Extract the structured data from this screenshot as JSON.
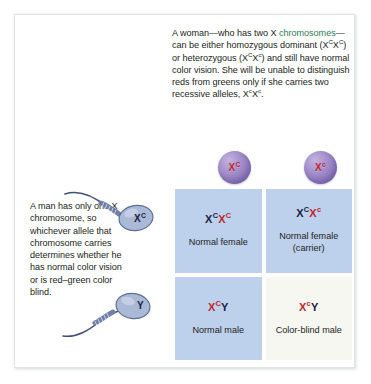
{
  "figure": {
    "female_caption": {
      "segments": [
        {
          "text": "A woman—who has two X ",
          "style": "normal"
        },
        {
          "text": "chromosomes",
          "style": "green"
        },
        {
          "text": "—can be either homozygous dominant (X",
          "style": "normal"
        },
        {
          "text": "C",
          "style": "sup"
        },
        {
          "text": "X",
          "style": "normal"
        },
        {
          "text": "C",
          "style": "sup"
        },
        {
          "text": ") or heterozygous (X",
          "style": "normal"
        },
        {
          "text": "C",
          "style": "sup"
        },
        {
          "text": "X",
          "style": "normal"
        },
        {
          "text": "c",
          "style": "sup"
        },
        {
          "text": ") and still have normal color vision. She will be unable to distinguish reds from greens only if she carries two recessive alleles, X",
          "style": "normal"
        },
        {
          "text": "c",
          "style": "sup"
        },
        {
          "text": "X",
          "style": "normal"
        },
        {
          "text": "c",
          "style": "sup"
        },
        {
          "text": ".",
          "style": "normal"
        }
      ],
      "plain_text": "A woman—who has two X chromosomes—can be either homozygous dominant (XCXC) or heterozygous (XCXc) and still have normal color vision. She will be unable to distinguish reds from greens only if she carries two recessive alleles, XcXc."
    },
    "male_caption": {
      "plain_text": "A man has only one X chromosome, so whichever allele that chromosome carries determines whether he has normal color vision or is red–green color blind."
    },
    "eggs": [
      {
        "name": "egg-dominant",
        "allele_base": "X",
        "allele_sup": "C",
        "color": "#8e78bd",
        "text_color": "#c0272d"
      },
      {
        "name": "egg-recessive",
        "allele_base": "X",
        "allele_sup": "c",
        "color": "#8e78bd",
        "text_color": "#c0272d"
      }
    ],
    "sperm": [
      {
        "name": "sperm-dominant",
        "allele_base": "X",
        "allele_sup": "C",
        "color": "#8fa6cc"
      },
      {
        "name": "sperm-y",
        "allele_base": "Y",
        "allele_sup": "",
        "color": "#8fa6cc"
      }
    ],
    "punnett": {
      "cells": [
        {
          "name": "offspring-normal-female",
          "genotype_parts": [
            {
              "text": "X",
              "color": "dark"
            },
            {
              "text": "C",
              "color": "dark",
              "sup": true
            },
            {
              "text": "X",
              "color": "red"
            },
            {
              "text": "C",
              "color": "red",
              "sup": true
            }
          ],
          "label": "Normal female",
          "bg": "#bdd0ec",
          "bg_class": "blue"
        },
        {
          "name": "offspring-carrier-female",
          "genotype_parts": [
            {
              "text": "X",
              "color": "dark"
            },
            {
              "text": "C",
              "color": "dark",
              "sup": true
            },
            {
              "text": "X",
              "color": "red"
            },
            {
              "text": "c",
              "color": "red",
              "sup": true
            }
          ],
          "label": "Normal female (carrier)",
          "bg": "#bdd0ec",
          "bg_class": "blue"
        },
        {
          "name": "offspring-normal-male",
          "genotype_parts": [
            {
              "text": "X",
              "color": "red"
            },
            {
              "text": "C",
              "color": "red",
              "sup": true
            },
            {
              "text": "Y",
              "color": "dark"
            }
          ],
          "label": "Normal male",
          "bg": "#bdd0ec",
          "bg_class": "blue"
        },
        {
          "name": "offspring-colorblind-male",
          "genotype_parts": [
            {
              "text": "X",
              "color": "red"
            },
            {
              "text": "c",
              "color": "red",
              "sup": true
            },
            {
              "text": "Y",
              "color": "dark"
            }
          ],
          "label": "Color-blind male",
          "bg": "#f7f7f2",
          "bg_class": "cream"
        }
      ]
    },
    "colors": {
      "recessive_red": "#c0272d",
      "dark_text": "#1a2340",
      "cell_blue": "#bdd0ec",
      "cell_cream": "#f7f7f2",
      "egg_purple": "#8e78bd",
      "sperm_blue": "#8fa6cc",
      "highlight_green": "#2f7d52"
    }
  }
}
